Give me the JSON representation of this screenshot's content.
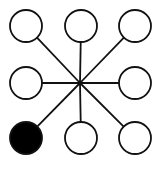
{
  "diagram": {
    "type": "star-network",
    "width": 160,
    "height": 169,
    "stroke_color": "#111111",
    "stroke_width": 1.8,
    "node_radius": 16,
    "hub": {
      "x": 80,
      "y": 83
    },
    "nodes": [
      {
        "id": "top-left",
        "x": 26,
        "y": 26,
        "filled": false
      },
      {
        "id": "top-center",
        "x": 81,
        "y": 26,
        "filled": false
      },
      {
        "id": "top-right",
        "x": 135,
        "y": 26,
        "filled": false
      },
      {
        "id": "middle-left",
        "x": 26,
        "y": 83,
        "filled": false
      },
      {
        "id": "middle-right",
        "x": 135,
        "y": 83,
        "filled": false
      },
      {
        "id": "bottom-left",
        "x": 26,
        "y": 138,
        "filled": true
      },
      {
        "id": "bottom-center",
        "x": 81,
        "y": 138,
        "filled": false
      },
      {
        "id": "bottom-right",
        "x": 135,
        "y": 138,
        "filled": false
      }
    ],
    "colors": {
      "background": "#ffffff",
      "node_fill": "#ffffff",
      "node_fill_selected": "#000000",
      "line": "#111111"
    }
  }
}
